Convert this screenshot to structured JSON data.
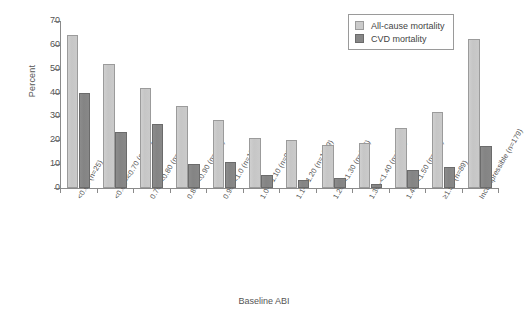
{
  "chart_data": {
    "type": "bar",
    "title": "",
    "xlabel": "Baseline ABI",
    "ylabel": "Percent",
    "ylim": [
      0,
      70
    ],
    "yticks": [
      0,
      10,
      20,
      30,
      40,
      50,
      60,
      70
    ],
    "grid": false,
    "legend_position": "top-right",
    "categories": [
      "<0.60 (n=25)",
      "<0.60–<0.70 (n=21)",
      "0.70–<0.80 (n=40)",
      "0.80–<0.90 (n=130)",
      "0.90–<1.0 (n=195)",
      "1.0–<1.10 (n=980)",
      "1.1–<1.20 (n=1399)",
      "1.20–<1.30 (n=954)",
      "1.30–<1.40 (n=245)",
      "1.40–<1.50 (n=136)",
      "≥1.50 (n=89)",
      "Incompressible (n=179)"
    ],
    "series": [
      {
        "name": "All-cause mortality",
        "color": "#c8c8c8",
        "values": [
          64,
          52,
          42,
          34.5,
          28.5,
          21,
          20,
          18,
          19,
          25,
          32,
          62.5
        ]
      },
      {
        "name": "CVD mortality",
        "color": "#878787",
        "values": [
          40,
          23.5,
          27,
          10,
          11,
          5.5,
          3.5,
          4,
          1.5,
          7.5,
          9,
          17.5
        ]
      }
    ]
  },
  "legend": {
    "items": [
      {
        "label": "All-cause mortality"
      },
      {
        "label": "CVD mortality"
      }
    ]
  },
  "axes": {
    "y_label": "Percent",
    "x_label": "Baseline ABI"
  }
}
